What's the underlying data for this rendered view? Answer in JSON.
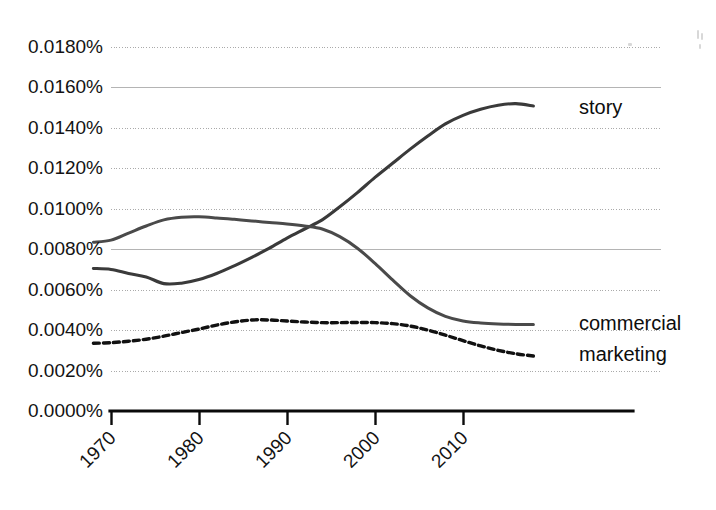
{
  "chart_data": {
    "type": "line",
    "title": "",
    "xlabel": "",
    "ylabel": "",
    "xlim": [
      1968,
      2019
    ],
    "ylim": [
      0.0,
      0.018
    ],
    "grid": true,
    "legend_position": "right-inline-labels",
    "y_tick_labels": [
      "0.0180%",
      "0.0160%",
      "0.0140%",
      "0.0120%",
      "0.0100%",
      "0.0080%",
      "0.0060%",
      "0.0040%",
      "0.0020%",
      "0.0000%"
    ],
    "y_tick_values": [
      0.018,
      0.016,
      0.014,
      0.012,
      0.01,
      0.008,
      0.006,
      0.004,
      0.002,
      0.0
    ],
    "x_tick_labels": [
      "1970",
      "1980",
      "1990",
      "2000",
      "2010"
    ],
    "x_tick_values": [
      1970,
      1980,
      1990,
      2000,
      2010
    ],
    "x": [
      1968,
      1970,
      1972,
      1974,
      1976,
      1978,
      1980,
      1982,
      1984,
      1986,
      1988,
      1990,
      1992,
      1994,
      1996,
      1998,
      2000,
      2002,
      2004,
      2006,
      2008,
      2010,
      2012,
      2014,
      2016,
      2018
    ],
    "series": [
      {
        "name": "story",
        "style": "solid",
        "color": "#3a3a3a",
        "label": "story",
        "values": [
          0.00705,
          0.007,
          0.0068,
          0.00663,
          0.0063,
          0.00632,
          0.0065,
          0.0068,
          0.00718,
          0.0076,
          0.00805,
          0.00855,
          0.009,
          0.00945,
          0.0101,
          0.0108,
          0.01155,
          0.01225,
          0.01295,
          0.0136,
          0.0142,
          0.01462,
          0.01492,
          0.01512,
          0.0152,
          0.01508
        ]
      },
      {
        "name": "commercial",
        "style": "solid",
        "color": "#4a4a4a",
        "label": "commercial",
        "values": [
          0.00835,
          0.00845,
          0.0088,
          0.00915,
          0.00945,
          0.00958,
          0.0096,
          0.00955,
          0.00948,
          0.0094,
          0.00932,
          0.00925,
          0.00915,
          0.009,
          0.00862,
          0.00805,
          0.0073,
          0.00648,
          0.0057,
          0.0051,
          0.00468,
          0.00445,
          0.00435,
          0.0043,
          0.00428,
          0.00428
        ]
      },
      {
        "name": "marketing",
        "style": "dashed",
        "color": "#111111",
        "label": "marketing",
        "values": [
          0.00335,
          0.00338,
          0.00345,
          0.00355,
          0.0037,
          0.00388,
          0.00405,
          0.00425,
          0.0044,
          0.0045,
          0.0045,
          0.00445,
          0.0044,
          0.00437,
          0.00437,
          0.00438,
          0.00437,
          0.00432,
          0.0042,
          0.004,
          0.00375,
          0.00348,
          0.00322,
          0.003,
          0.00283,
          0.00272
        ]
      }
    ],
    "series_labels": [
      {
        "text": "story",
        "x": 2018,
        "y": 0.01495
      },
      {
        "text": "commercial",
        "x": 2018,
        "y": 0.00425
      },
      {
        "text": "marketing",
        "x": 2018,
        "y": 0.00275
      }
    ]
  }
}
